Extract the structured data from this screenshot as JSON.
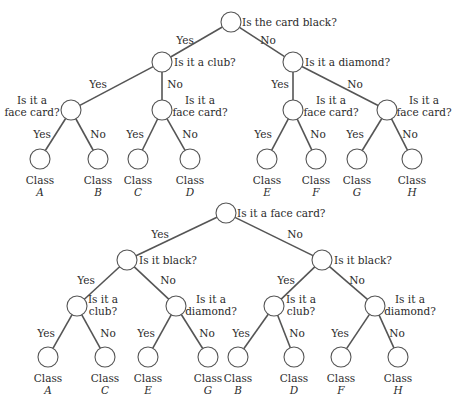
{
  "style": {
    "line_color": "#555555",
    "text_color": "#2b2b2b",
    "background": "#ffffff",
    "node_radius": 10
  },
  "trees": [
    {
      "name": "tree-color-first",
      "nodes": [
        {
          "id": "root",
          "x": 231,
          "y": 22,
          "question": [
            "Is the card black?"
          ],
          "qx": 242,
          "qy": 26,
          "anchor": "start"
        },
        {
          "id": "club",
          "x": 162,
          "y": 62,
          "question": [
            "Is it a club?"
          ],
          "qx": 174,
          "qy": 66,
          "anchor": "start"
        },
        {
          "id": "diamond",
          "x": 293,
          "y": 62,
          "question": [
            "Is it a diamond?"
          ],
          "qx": 305,
          "qy": 66,
          "anchor": "start"
        },
        {
          "id": "face1",
          "x": 71,
          "y": 110,
          "question": [
            "Is it a",
            "face card?"
          ],
          "qx": 32,
          "qy": 104,
          "anchor": "middle"
        },
        {
          "id": "face2",
          "x": 162,
          "y": 110,
          "question": [
            "Is it a",
            "face card?"
          ],
          "qx": 200,
          "qy": 104,
          "anchor": "middle"
        },
        {
          "id": "face3",
          "x": 293,
          "y": 110,
          "question": [
            "Is it a",
            "face card?"
          ],
          "qx": 331,
          "qy": 104,
          "anchor": "middle"
        },
        {
          "id": "face4",
          "x": 387,
          "y": 110,
          "question": [
            "Is it a",
            "face card?"
          ],
          "qx": 424,
          "qy": 104,
          "anchor": "middle"
        }
      ],
      "edges": [
        {
          "from": "root",
          "to": "club",
          "label": "Yes",
          "lx": 185,
          "ly": 44
        },
        {
          "from": "root",
          "to": "diamond",
          "label": "No",
          "lx": 268,
          "ly": 44
        },
        {
          "from": "club",
          "to": "face1",
          "label": "Yes",
          "lx": 98,
          "ly": 88
        },
        {
          "from": "club",
          "to": "face2",
          "label": "No",
          "lx": 175,
          "ly": 88
        },
        {
          "from": "diamond",
          "to": "face3",
          "label": "Yes",
          "lx": 280,
          "ly": 88
        },
        {
          "from": "diamond",
          "to": "face4",
          "label": "No",
          "lx": 355,
          "ly": 88
        }
      ],
      "leaves": [
        {
          "parent": "face1",
          "x": 40,
          "y": 159,
          "class_word": "Class",
          "letter": "A",
          "edge_label": "Yes",
          "lx": 42,
          "ly": 138
        },
        {
          "parent": "face1",
          "x": 98,
          "y": 159,
          "class_word": "Class",
          "letter": "B",
          "edge_label": "No",
          "lx": 98,
          "ly": 138
        },
        {
          "parent": "face2",
          "x": 138,
          "y": 159,
          "class_word": "Class",
          "letter": "C",
          "edge_label": "Yes",
          "lx": 135,
          "ly": 138
        },
        {
          "parent": "face2",
          "x": 190,
          "y": 159,
          "class_word": "Class",
          "letter": "D",
          "edge_label": "No",
          "lx": 190,
          "ly": 138
        },
        {
          "parent": "face3",
          "x": 267,
          "y": 159,
          "class_word": "Class",
          "letter": "E",
          "edge_label": "Yes",
          "lx": 263,
          "ly": 138
        },
        {
          "parent": "face3",
          "x": 316,
          "y": 159,
          "class_word": "Class",
          "letter": "F",
          "edge_label": "No",
          "lx": 318,
          "ly": 138
        },
        {
          "parent": "face4",
          "x": 357,
          "y": 159,
          "class_word": "Class",
          "letter": "G",
          "edge_label": "Yes",
          "lx": 355,
          "ly": 138
        },
        {
          "parent": "face4",
          "x": 412,
          "y": 159,
          "class_word": "Class",
          "letter": "H",
          "edge_label": "No",
          "lx": 410,
          "ly": 138
        }
      ]
    },
    {
      "name": "tree-face-first",
      "nodes": [
        {
          "id": "root",
          "x": 226,
          "y": 213,
          "question": [
            "Is it a face card?"
          ],
          "qx": 237,
          "qy": 217,
          "anchor": "start"
        },
        {
          "id": "black1",
          "x": 127,
          "y": 260,
          "question": [
            "Is it black?"
          ],
          "qx": 139,
          "qy": 264,
          "anchor": "start"
        },
        {
          "id": "black2",
          "x": 322,
          "y": 260,
          "question": [
            "Is it black?"
          ],
          "qx": 334,
          "qy": 264,
          "anchor": "start"
        },
        {
          "id": "club1",
          "x": 77,
          "y": 306,
          "question": [
            "Is it a",
            "club?"
          ],
          "qx": 103,
          "qy": 303,
          "anchor": "middle"
        },
        {
          "id": "diamond1",
          "x": 176,
          "y": 306,
          "question": [
            "Is it a",
            "diamond?"
          ],
          "qx": 211,
          "qy": 303,
          "anchor": "middle"
        },
        {
          "id": "club2",
          "x": 274,
          "y": 306,
          "question": [
            "Is it a",
            "club?"
          ],
          "qx": 301,
          "qy": 303,
          "anchor": "middle"
        },
        {
          "id": "diamond2",
          "x": 375,
          "y": 306,
          "question": [
            "Is it a",
            "diamond?"
          ],
          "qx": 410,
          "qy": 303,
          "anchor": "middle"
        }
      ],
      "edges": [
        {
          "from": "root",
          "to": "black1",
          "label": "Yes",
          "lx": 160,
          "ly": 238
        },
        {
          "from": "root",
          "to": "black2",
          "label": "No",
          "lx": 295,
          "ly": 238
        },
        {
          "from": "black1",
          "to": "club1",
          "label": "Yes",
          "lx": 86,
          "ly": 284
        },
        {
          "from": "black1",
          "to": "diamond1",
          "label": "No",
          "lx": 168,
          "ly": 284
        },
        {
          "from": "black2",
          "to": "club2",
          "label": "Yes",
          "lx": 286,
          "ly": 284
        },
        {
          "from": "black2",
          "to": "diamond2",
          "label": "No",
          "lx": 357,
          "ly": 284
        }
      ],
      "leaves": [
        {
          "parent": "club1",
          "x": 48,
          "y": 357,
          "class_word": "Class",
          "letter": "A",
          "edge_label": "Yes",
          "lx": 46,
          "ly": 337
        },
        {
          "parent": "club1",
          "x": 105,
          "y": 357,
          "class_word": "Class",
          "letter": "C",
          "edge_label": "No",
          "lx": 108,
          "ly": 337
        },
        {
          "parent": "diamond1",
          "x": 148,
          "y": 357,
          "class_word": "Class",
          "letter": "E",
          "edge_label": "Yes",
          "lx": 146,
          "ly": 337
        },
        {
          "parent": "diamond1",
          "x": 208,
          "y": 357,
          "class_word": "Class",
          "letter": "G",
          "edge_label": "No",
          "lx": 207,
          "ly": 337
        },
        {
          "parent": "club2",
          "x": 238,
          "y": 357,
          "class_word": "Class",
          "letter": "B",
          "edge_label": "Yes",
          "lx": 241,
          "ly": 337
        },
        {
          "parent": "club2",
          "x": 294,
          "y": 357,
          "class_word": "Class",
          "letter": "D",
          "edge_label": "No",
          "lx": 297,
          "ly": 337
        },
        {
          "parent": "diamond2",
          "x": 341,
          "y": 357,
          "class_word": "Class",
          "letter": "F",
          "edge_label": "Yes",
          "lx": 340,
          "ly": 337
        },
        {
          "parent": "diamond2",
          "x": 398,
          "y": 357,
          "class_word": "Class",
          "letter": "H",
          "edge_label": "No",
          "lx": 397,
          "ly": 337
        }
      ]
    }
  ]
}
